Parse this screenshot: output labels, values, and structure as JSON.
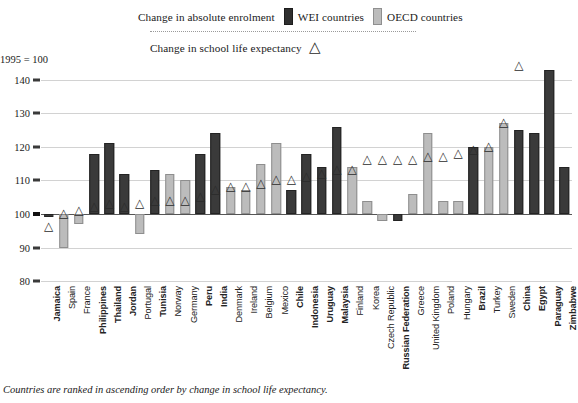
{
  "legend": {
    "enrolment_label": "Change in absolute enrolment",
    "wei_label": "WEI countries",
    "oecd_label": "OECD countries",
    "expectancy_label": "Change in school life expectancy",
    "marker_glyph": "△",
    "wei_color": "#3a3a3a",
    "oecd_color": "#bcbcbc"
  },
  "axis": {
    "base_note": "1995 = 100",
    "ticks": [
      140,
      130,
      120,
      110,
      100,
      90,
      80
    ]
  },
  "footnote": "Countries are ranked in ascending order by change in school life expectancy.",
  "chart_data": {
    "type": "bar",
    "title": "",
    "subtitle": "",
    "xlabel": "",
    "ylabel": "1995 = 100",
    "ylim": [
      80,
      145
    ],
    "grid": true,
    "legend_position": "top",
    "baseline": 100,
    "annotation": "Countries are ranked in ascending order by change in school life expectancy.",
    "series": [
      {
        "name": "Change in absolute enrolment",
        "group_key": "group"
      },
      {
        "name": "Change in school life expectancy",
        "marker": "triangle"
      }
    ],
    "categories": [
      "Jamaica",
      "Spain",
      "France",
      "Philippines",
      "Thailand",
      "Jordan",
      "Portugal",
      "Tunisia",
      "Norway",
      "Germany",
      "Peru",
      "India",
      "Denmark",
      "Ireland",
      "Belgium",
      "Mexico",
      "Chile",
      "Indonesia",
      "Uruguay",
      "Malaysia",
      "Finland",
      "Korea",
      "Czech Republic",
      "Russian Federation",
      "Greece",
      "United Kingdom",
      "Poland",
      "Hungary",
      "Brazil",
      "Turkey",
      "Sweden",
      "China",
      "Egypt",
      "Paraguay",
      "Zimbabwe"
    ],
    "groups": [
      "WEI",
      "OECD",
      "OECD",
      "WEI",
      "WEI",
      "WEI",
      "OECD",
      "WEI",
      "OECD",
      "OECD",
      "WEI",
      "WEI",
      "OECD",
      "OECD",
      "OECD",
      "OECD",
      "WEI",
      "WEI",
      "WEI",
      "WEI",
      "OECD",
      "OECD",
      "OECD",
      "WEI",
      "OECD",
      "OECD",
      "OECD",
      "OECD",
      "WEI",
      "OECD",
      "OECD",
      "WEI",
      "WEI",
      "WEI",
      "WEI"
    ],
    "enrolment": [
      99,
      90,
      97,
      118,
      121,
      112,
      94,
      113,
      112,
      110,
      118,
      124,
      108,
      107,
      115,
      121,
      107,
      118,
      114,
      126,
      114,
      104,
      98,
      98,
      106,
      124,
      104,
      104,
      120,
      120,
      127,
      125,
      124,
      143,
      114
    ],
    "life_expectancy": [
      96,
      100,
      101,
      102,
      103,
      102,
      103,
      104,
      104,
      104,
      105,
      107,
      108,
      108,
      109,
      110,
      110,
      111,
      112,
      113,
      113,
      116,
      116,
      116,
      116,
      117,
      117,
      118,
      119,
      120,
      127,
      144,
      0,
      0,
      0
    ]
  }
}
